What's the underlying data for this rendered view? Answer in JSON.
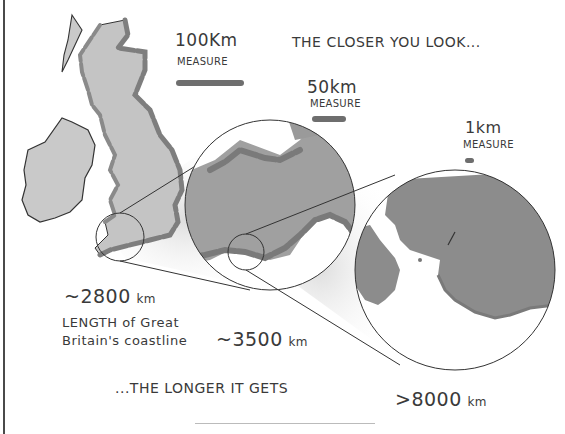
{
  "heading_top": "THE CLOSER YOU LOOK...",
  "heading_bottom": "...THE LONGER IT GETS",
  "scales": [
    {
      "value": "100Km",
      "label": "MEASURE",
      "bar_width": 68
    },
    {
      "value": "50km",
      "label": "MEASURE",
      "bar_width": 34
    },
    {
      "value": "1km",
      "label": "MEASURE",
      "bar_width": 9
    }
  ],
  "measurements": [
    {
      "prefix": "~",
      "number": "2800",
      "unit": "km"
    },
    {
      "prefix": "~",
      "number": "3500",
      "unit": "km"
    },
    {
      "prefix": ">",
      "number": "8000",
      "unit": "km"
    }
  ],
  "caption_line1": "LENGTH of Great",
  "caption_line2": "Britain's coastline",
  "colors": {
    "land_light": "#c9c9c9",
    "land_mid": "#9a9a9a",
    "land_dark": "#8a8a8a",
    "coast_stroke": "#7a7a7a",
    "outline": "#333333"
  }
}
